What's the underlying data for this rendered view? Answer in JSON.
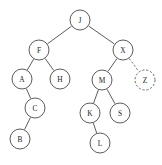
{
  "figure": {
    "width": 162,
    "height": 165,
    "background_color": "#ffffff",
    "stroke_color": "#4a4a4a",
    "label_color": "#1d1d1d",
    "node_radius": 10,
    "dashed_note": "Node Z and its edge from X are drawn with dashed outlines"
  },
  "chart_data": {
    "type": "diagram",
    "diagram_kind": "binary-search-tree",
    "node_count": 12,
    "nodes": [
      {
        "id": "J",
        "label": "J",
        "x": 80,
        "y": 20,
        "r": 10,
        "style": "solid",
        "depth": 0,
        "parent": null,
        "side": null
      },
      {
        "id": "F",
        "label": "F",
        "x": 39,
        "y": 50,
        "r": 10,
        "style": "solid",
        "depth": 1,
        "parent": "J",
        "side": "left"
      },
      {
        "id": "X",
        "label": "X",
        "x": 123,
        "y": 50,
        "r": 10,
        "style": "solid",
        "depth": 1,
        "parent": "J",
        "side": "right"
      },
      {
        "id": "A",
        "label": "A",
        "x": 22,
        "y": 79,
        "r": 10,
        "style": "solid",
        "depth": 2,
        "parent": "F",
        "side": "left"
      },
      {
        "id": "H",
        "label": "H",
        "x": 60,
        "y": 79,
        "r": 10,
        "style": "solid",
        "depth": 2,
        "parent": "F",
        "side": "right"
      },
      {
        "id": "M",
        "label": "M",
        "x": 102,
        "y": 80,
        "r": 10,
        "style": "solid",
        "depth": 2,
        "parent": "X",
        "side": "left"
      },
      {
        "id": "Z",
        "label": "Z",
        "x": 145,
        "y": 80,
        "r": 10,
        "style": "dashed",
        "depth": 2,
        "parent": "X",
        "side": "right"
      },
      {
        "id": "C",
        "label": "C",
        "x": 35,
        "y": 108,
        "r": 10,
        "style": "solid",
        "depth": 3,
        "parent": "A",
        "side": "right"
      },
      {
        "id": "K",
        "label": "K",
        "x": 90,
        "y": 113,
        "r": 10,
        "style": "solid",
        "depth": 3,
        "parent": "M",
        "side": "left"
      },
      {
        "id": "S",
        "label": "S",
        "x": 120,
        "y": 113,
        "r": 10,
        "style": "solid",
        "depth": 3,
        "parent": "M",
        "side": "right"
      },
      {
        "id": "B",
        "label": "B",
        "x": 20,
        "y": 139,
        "r": 10,
        "style": "solid",
        "depth": 4,
        "parent": "C",
        "side": "left"
      },
      {
        "id": "L",
        "label": "L",
        "x": 100,
        "y": 143,
        "r": 10,
        "style": "solid",
        "depth": 4,
        "parent": "K",
        "side": "right"
      }
    ],
    "edges": [
      {
        "from": "J",
        "to": "F",
        "style": "solid"
      },
      {
        "from": "J",
        "to": "X",
        "style": "solid"
      },
      {
        "from": "F",
        "to": "A",
        "style": "solid"
      },
      {
        "from": "F",
        "to": "H",
        "style": "solid"
      },
      {
        "from": "X",
        "to": "M",
        "style": "solid"
      },
      {
        "from": "X",
        "to": "Z",
        "style": "dashed"
      },
      {
        "from": "A",
        "to": "C",
        "style": "solid"
      },
      {
        "from": "C",
        "to": "B",
        "style": "solid"
      },
      {
        "from": "M",
        "to": "K",
        "style": "solid"
      },
      {
        "from": "M",
        "to": "S",
        "style": "solid"
      },
      {
        "from": "K",
        "to": "L",
        "style": "solid"
      }
    ]
  }
}
